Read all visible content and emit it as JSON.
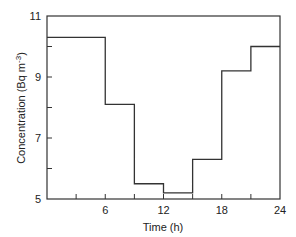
{
  "chart_data": {
    "type": "line",
    "style": "step",
    "title": "",
    "xlabel": "Time (h)",
    "ylabel": "Concentration (Bq m^-3)",
    "ylabel_main": "Concentration (Bq  m",
    "ylabel_sup": "-3",
    "ylabel_close": ")",
    "xlim": [
      0,
      24
    ],
    "ylim": [
      5,
      11
    ],
    "x_ticks": [
      0,
      3,
      6,
      9,
      12,
      15,
      18,
      21,
      24
    ],
    "x_tick_labels": [
      "6",
      "12",
      "18",
      "24"
    ],
    "x_tick_label_values": [
      6,
      12,
      18,
      24
    ],
    "y_ticks": [
      5,
      6,
      7,
      8,
      9,
      10,
      11
    ],
    "y_tick_labels": [
      "5",
      "7",
      "9",
      "11"
    ],
    "y_tick_label_values": [
      5,
      7,
      9,
      11
    ],
    "grid": false,
    "legend": null,
    "series": [
      {
        "name": "Concentration",
        "intervals": [
          {
            "x_start": 0,
            "x_end": 6,
            "value": 10.3
          },
          {
            "x_start": 6,
            "x_end": 9,
            "value": 8.1
          },
          {
            "x_start": 9,
            "x_end": 12,
            "value": 5.5
          },
          {
            "x_start": 12,
            "x_end": 15,
            "value": 5.2
          },
          {
            "x_start": 15,
            "x_end": 18,
            "value": 6.3
          },
          {
            "x_start": 18,
            "x_end": 21,
            "value": 9.2
          },
          {
            "x_start": 21,
            "x_end": 24,
            "value": 10.0
          }
        ]
      }
    ]
  }
}
